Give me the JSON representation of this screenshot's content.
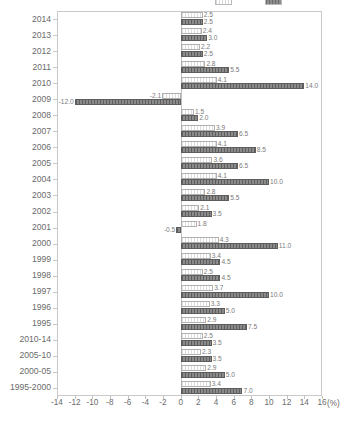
{
  "chart_data": {
    "type": "bar",
    "orientation": "horizontal",
    "title": "",
    "xlabel": "(%)",
    "ylabel": "",
    "xlim": [
      -14,
      16
    ],
    "xticks": [
      -14,
      -12,
      -10,
      -8,
      -6,
      -4,
      -2,
      0,
      2,
      4,
      6,
      8,
      10,
      12,
      14,
      16
    ],
    "xtick_labels": [
      "-14",
      "-12",
      "-10",
      "-8",
      "-6",
      "-4",
      "-2",
      "0",
      "2",
      "4",
      "6",
      "8",
      "10",
      "12",
      "14",
      "16"
    ],
    "grid": false,
    "legend_position": "top-right",
    "categories": [
      "2014",
      "2013",
      "2012",
      "2011",
      "2010",
      "2009",
      "2008",
      "2007",
      "2006",
      "2005",
      "2004",
      "2003",
      "2002",
      "2001",
      "2000",
      "1999",
      "1998",
      "1997",
      "1996",
      "1995",
      "2010-14",
      "2005-10",
      "2000-05",
      "1995-2000"
    ],
    "series": [
      {
        "name": "",
        "style": "light",
        "values": [
          2.5,
          2.4,
          2.2,
          2.8,
          4.1,
          -2.1,
          1.5,
          3.9,
          4.1,
          3.6,
          4.1,
          2.8,
          2.1,
          1.8,
          4.3,
          3.4,
          2.5,
          3.7,
          3.3,
          2.9,
          2.5,
          2.3,
          2.9,
          3.4
        ],
        "value_labels": [
          "2.5",
          "2.4",
          "2.2",
          "2.8",
          "4.1",
          "-2.1",
          "1.5",
          "3.9",
          "4.1",
          "3.6",
          "4.1",
          "2.8",
          "2.1",
          "1.8",
          "4.3",
          "3.4",
          "2.5",
          "3.7",
          "3.3",
          "2.9",
          "2.5",
          "2.3",
          "2.9",
          "3.4"
        ]
      },
      {
        "name": "",
        "style": "dark",
        "values": [
          2.5,
          3.0,
          2.5,
          5.5,
          14.0,
          -12.0,
          2.0,
          6.5,
          8.5,
          6.5,
          10.0,
          5.5,
          3.5,
          -0.5,
          11.0,
          4.5,
          4.5,
          10.0,
          5.0,
          7.5,
          3.5,
          3.5,
          5.0,
          7.0
        ],
        "value_labels": [
          "2.5",
          "3.0",
          "2.5",
          "5.5",
          "14.0",
          "-12.0",
          "2.0",
          "6.5",
          "8.5",
          "6.5",
          "10.0",
          "5.5",
          "3.5",
          "-0.5",
          "11.0",
          "4.5",
          "4.5",
          "10.0",
          "5.0",
          "7.5",
          "3.5",
          "3.5",
          "5.0",
          "7.0"
        ]
      }
    ],
    "legend": [
      {
        "label": "",
        "style": "light"
      },
      {
        "label": "",
        "style": "dark"
      }
    ],
    "colors": {
      "light_bar": "#f2f2f2",
      "dark_bar": "#767676",
      "axis": "#c9c9c9",
      "text": "#6b6b6b",
      "background": "#ffffff"
    }
  }
}
